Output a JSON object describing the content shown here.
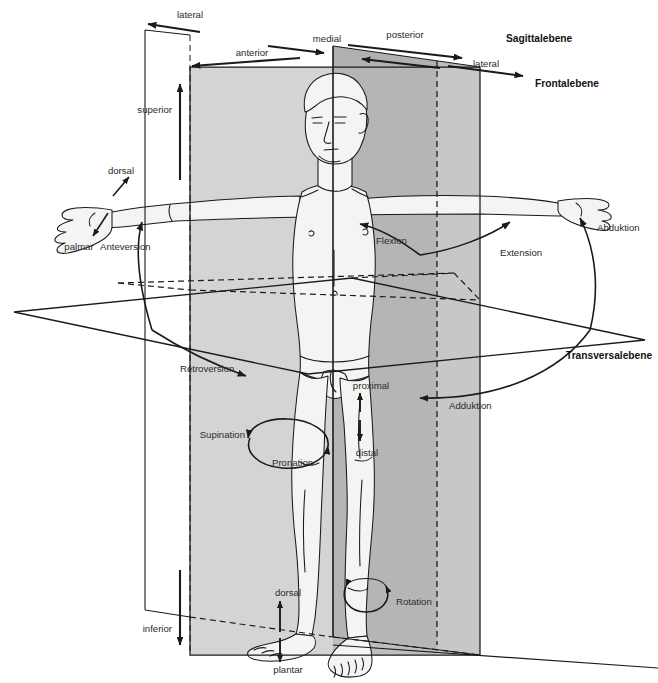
{
  "figure": {
    "width": 658,
    "height": 683,
    "background_color": "#ffffff",
    "line_color": "#1a1a1a",
    "body_fill": "#f2f2f0",
    "plane_fills": {
      "frontal_light": "#c9c9c9",
      "sagittal_mid": "#b4b4b4",
      "sagittal_dark": "#a5a5a5",
      "transversal": "#ffffff"
    }
  },
  "planes": [
    {
      "id": "sagittal",
      "label": "Sagittalebene",
      "bold": true
    },
    {
      "id": "frontal",
      "label": "Frontalebene",
      "bold": true
    },
    {
      "id": "transversal",
      "label": "Transversalebene",
      "bold": true
    }
  ],
  "direction_labels": [
    {
      "id": "lateral-top-left",
      "label": "lateral"
    },
    {
      "id": "medial",
      "label": "medial"
    },
    {
      "id": "posterior",
      "label": "posterior"
    },
    {
      "id": "anterior",
      "label": "anterior"
    },
    {
      "id": "lateral-right",
      "label": "lateral"
    },
    {
      "id": "superior",
      "label": "superior"
    },
    {
      "id": "inferior",
      "label": "inferior"
    },
    {
      "id": "proximal",
      "label": "proximal"
    },
    {
      "id": "distal",
      "label": "distal"
    },
    {
      "id": "dorsal-hand",
      "label": "dorsal"
    },
    {
      "id": "palmar",
      "label": "palmar"
    },
    {
      "id": "dorsal-foot",
      "label": "dorsal"
    },
    {
      "id": "plantar",
      "label": "plantar"
    }
  ],
  "movement_labels": [
    {
      "id": "anteversion",
      "label": "Anteversion"
    },
    {
      "id": "retroversion",
      "label": "Retroversion"
    },
    {
      "id": "flexion",
      "label": "Flexion"
    },
    {
      "id": "extension",
      "label": "Extension"
    },
    {
      "id": "abduktion",
      "label": "Abduktion"
    },
    {
      "id": "adduktion",
      "label": "Adduktion"
    },
    {
      "id": "supination",
      "label": "Supination"
    },
    {
      "id": "pronation",
      "label": "Pronation"
    },
    {
      "id": "rotation",
      "label": "Rotation"
    }
  ]
}
